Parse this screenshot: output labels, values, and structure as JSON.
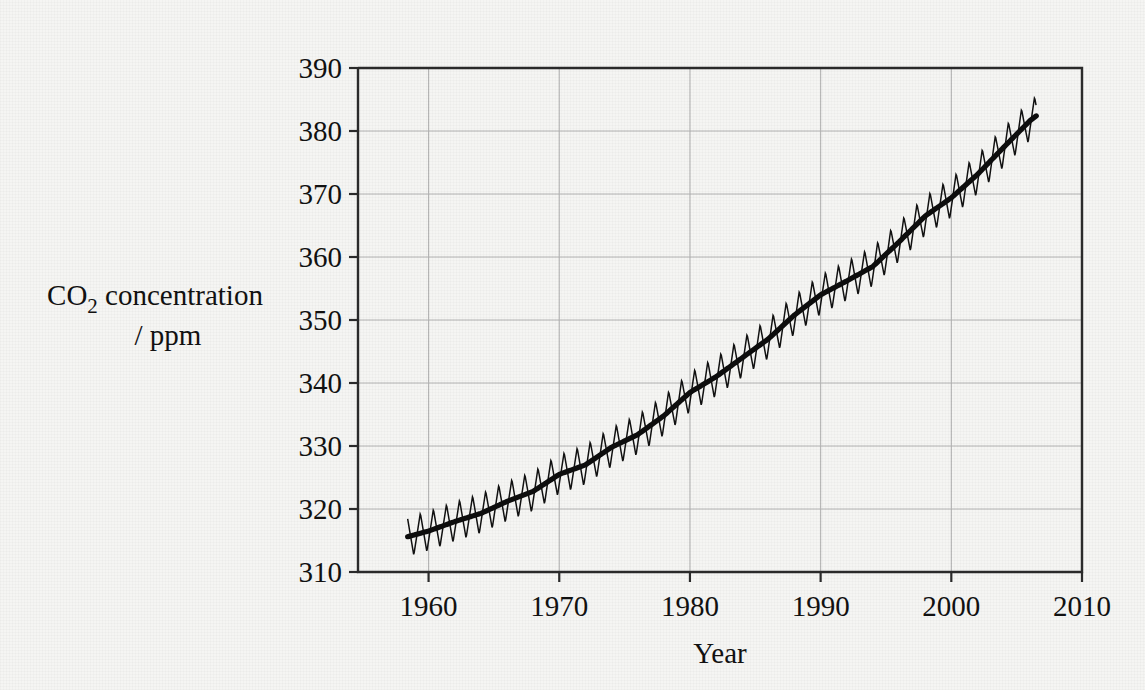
{
  "figure": {
    "background_color": "#f5f5f3",
    "axis_color": "#2b2b2b",
    "grid_color": "#b4b4b4",
    "series_color": "#111111"
  },
  "ylabel": {
    "line1_pre": "CO",
    "line1_sub": "2",
    "line1_post": " concentration",
    "line2": "/ ppm"
  },
  "xlabel": "Year",
  "chart_data": {
    "type": "line",
    "title": "",
    "subtitle": "",
    "xlabel": "Year",
    "ylabel": "CO2 concentration / ppm",
    "xlim": [
      1954.6,
      2010
    ],
    "ylim": [
      310,
      390
    ],
    "xticks": [
      1960,
      1970,
      1980,
      1990,
      2000,
      2010
    ],
    "xtick_labels": [
      "1960",
      "1970",
      "1980",
      "1990",
      "2000",
      "2010"
    ],
    "yticks": [
      310,
      320,
      330,
      340,
      350,
      360,
      370,
      380,
      390
    ],
    "ytick_labels": [
      "310",
      "320",
      "330",
      "340",
      "350",
      "360",
      "370",
      "380",
      "390"
    ],
    "grid": "both-axes-light-gray",
    "legend": "none",
    "annotations": [],
    "series": [
      {
        "name": "Monthly mean CO2 (seasonal sawtooth)",
        "style": "thin-line",
        "x_start": 1958.4,
        "x_end": 2006.5,
        "seasonal_amplitude_ppm": 3.2,
        "seasonal_peak_month_fraction": 0.37,
        "note": "Monthly values oscillate about the trend with roughly +/-3 ppm annual cycle, peaking in late spring and troughing in early autumn."
      },
      {
        "name": "Smoothed annual trend",
        "style": "thick-line",
        "x": [
          1958.4,
          1960,
          1962,
          1964,
          1966,
          1968,
          1970,
          1972,
          1974,
          1976,
          1978,
          1980,
          1982,
          1984,
          1986,
          1988,
          1990,
          1992,
          1994,
          1996,
          1998,
          2000,
          2002,
          2004,
          2006,
          2006.5
        ],
        "values": [
          315.6,
          316.5,
          318.0,
          319.3,
          321.2,
          322.8,
          325.5,
          327.0,
          329.8,
          331.8,
          334.8,
          338.5,
          341.0,
          344.0,
          347.0,
          350.8,
          354.0,
          356.2,
          358.5,
          362.4,
          366.5,
          369.4,
          373.1,
          377.4,
          381.6,
          382.4
        ],
        "note": "Deseasonalised smoothed Keeling-curve trend rising from about 315.6 ppm in 1958 to about 382 ppm in 2006."
      }
    ]
  }
}
